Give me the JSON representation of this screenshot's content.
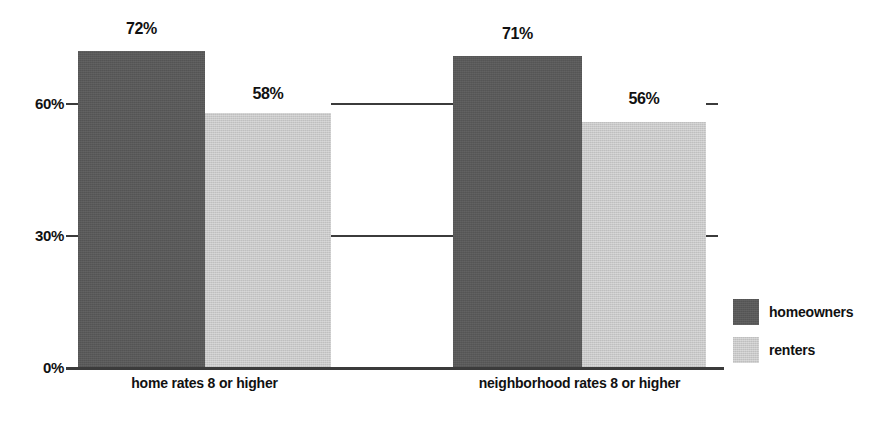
{
  "chart_data": {
    "type": "bar",
    "title": "",
    "subtitle": "",
    "xlabel": "",
    "ylabel": "",
    "categories": [
      "home rates 8 or higher",
      "neighborhood rates 8 or higher"
    ],
    "series": [
      {
        "name": "homeowners",
        "color": "#595959",
        "values": [
          72,
          71
        ],
        "value_labels": [
          "72%",
          "71%"
        ]
      },
      {
        "name": "renters",
        "color": "#c9c9c9",
        "values": [
          58,
          56
        ],
        "value_labels": [
          "58%",
          "56%"
        ]
      }
    ],
    "ylim": [
      0,
      80
    ],
    "yticks": [
      0,
      30,
      60
    ],
    "ytick_labels": [
      "0%",
      "30%",
      "60%"
    ],
    "grid": true,
    "grid_note": "horizontal gridlines at 30% and 60% visible only in the gap between the two category groups; short tick marks at left and right edges",
    "legend_position": "right",
    "background_color": "#ffffff",
    "axis_color": "#3b3b3b",
    "text_color": "#111111"
  },
  "axis": {
    "y_ticks": [
      {
        "label": "60%",
        "value": 60
      },
      {
        "label": "30%",
        "value": 30
      },
      {
        "label": "0%",
        "value": 0
      }
    ]
  },
  "legend": {
    "items": [
      {
        "label": "homeowners",
        "color": "#595959"
      },
      {
        "label": "renters",
        "color": "#c9c9c9"
      }
    ]
  }
}
